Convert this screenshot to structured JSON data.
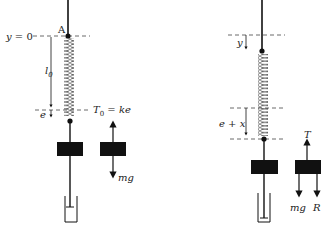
{
  "figure": {
    "left_panel": {
      "labels": {
        "reference_line": "y = 0",
        "point": "A",
        "natural_length": "l",
        "natural_length_sub": "0",
        "extension": "e",
        "tension": "T",
        "tension_sub": "0",
        "tension_eq": " = ke",
        "weight": "mg"
      }
    },
    "right_panel": {
      "labels": {
        "displacement": "y",
        "extension": "e + x",
        "tension": "T",
        "weight": "mg",
        "resistance": "R"
      }
    },
    "colors": {
      "ink": "#111111",
      "dash": "#444444",
      "background": "#ffffff"
    }
  }
}
